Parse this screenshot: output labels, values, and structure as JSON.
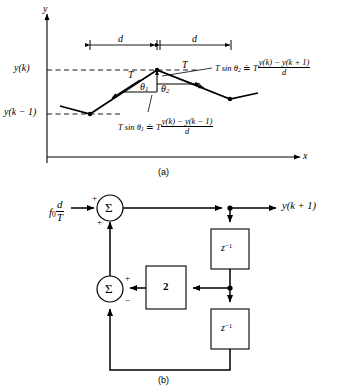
{
  "figure": {
    "panel_a": {
      "caption": "(a)",
      "axis_y_label": "y",
      "axis_x_label": "x",
      "ytick_upper": "y(k)",
      "ytick_lower": "y(k − 1)",
      "span_left_label": "d",
      "span_right_label": "d",
      "tension_left_label": "T",
      "tension_right_label": "T",
      "angle_left_label": "θ",
      "angle_left_sub": "1",
      "angle_right_label": "θ",
      "angle_right_sub": "2",
      "formula_upper": {
        "lead": "T sin θ",
        "lead_sub": "2",
        "relation": "≐",
        "factor": "T",
        "numerator": "y(k) − y(k + 1)",
        "denominator": "d"
      },
      "formula_lower": {
        "lead": "T sin θ",
        "lead_sub": "1",
        "relation": "≐",
        "factor": "T",
        "numerator": "y(k) − y(k − 1)",
        "denominator": "d"
      }
    },
    "panel_b": {
      "caption": "(b)",
      "input_label": "f",
      "input_sub": "0",
      "input_frac_num": "d",
      "input_frac_den": "T",
      "output_label": "y(k + 1)",
      "summer_symbol": "Σ",
      "summer_top_sign_in": "+",
      "summer_top_sign_feedback": "+",
      "summer_bottom_sign_right": "+",
      "summer_bottom_sign_down": "−",
      "gain_label": "2",
      "delay_top_label": "z",
      "delay_top_exp": "−1",
      "delay_bottom_label": "z",
      "delay_bottom_exp": "−1"
    }
  },
  "colors": {
    "ink": "#000000",
    "paper": "#ffffff",
    "dash": "#000000"
  }
}
